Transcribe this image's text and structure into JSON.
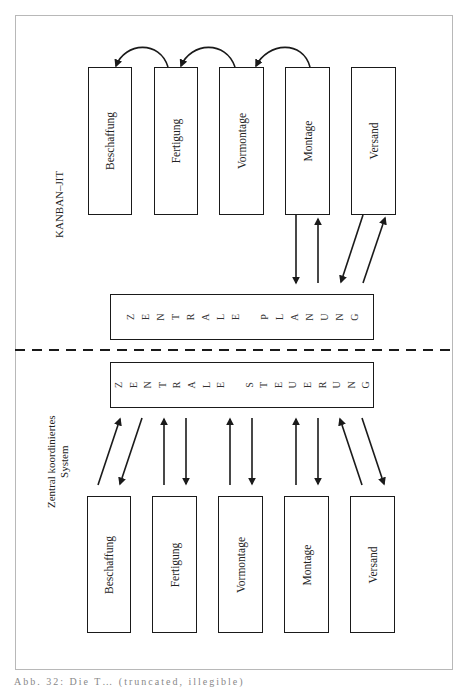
{
  "figure": {
    "top_section_label": "KANBAN–JIT",
    "bottom_section_label_line1": "Zentral koordiniertes",
    "bottom_section_label_line2": "System",
    "top_boxes": [
      {
        "label": "Beschaffung"
      },
      {
        "label": "Fertigung"
      },
      {
        "label": "Vormontage"
      },
      {
        "label": "Montage"
      },
      {
        "label": "Versand"
      }
    ],
    "central_planning": {
      "label": "ZENTRALE PLANUNG",
      "letters": [
        "Z",
        "E",
        "N",
        "T",
        "R",
        "A",
        "L",
        "E",
        " ",
        "P",
        "L",
        "A",
        "N",
        "U",
        "N",
        "G"
      ]
    },
    "central_control": {
      "label": "ZENTRALE STEUERUNG",
      "letters": [
        "Z",
        "E",
        "N",
        "T",
        "R",
        "A",
        "L",
        "E",
        " ",
        "S",
        "T",
        "E",
        "U",
        "E",
        "R",
        "U",
        "N",
        "G"
      ]
    },
    "bottom_boxes": [
      {
        "label": "Beschaffung"
      },
      {
        "label": "Fertigung"
      },
      {
        "label": "Vormontage"
      },
      {
        "label": "Montage"
      },
      {
        "label": "Versand"
      }
    ],
    "kanban_pull_arrows": [
      {
        "from": "Fertigung",
        "to": "Beschaffung"
      },
      {
        "from": "Vormontage",
        "to": "Fertigung"
      },
      {
        "from": "Montage",
        "to": "Vormontage"
      }
    ],
    "top_planning_links": [
      "Montage",
      "Versand"
    ],
    "bottom_control_links": [
      "Beschaffung",
      "Fertigung",
      "Vormontage",
      "Montage",
      "Versand"
    ],
    "separator": "dashed",
    "caption": "Abb. 32: Die T… (truncated, illegible)"
  },
  "colors": {
    "line": "#1a1a1a",
    "frame": "#b8b8b8",
    "background": "#ffffff"
  }
}
